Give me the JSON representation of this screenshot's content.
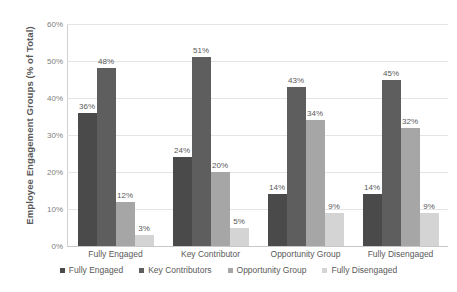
{
  "chart_data": {
    "type": "bar",
    "title": "",
    "xlabel": "",
    "ylabel": "Employee Engagement Groups (% of Total)",
    "ylim": [
      0,
      60
    ],
    "ytick_labels": [
      "60%",
      "50%",
      "40%",
      "30%",
      "20%",
      "10%",
      "0%"
    ],
    "ytick_values": [
      60,
      50,
      40,
      30,
      20,
      10,
      0
    ],
    "grid": true,
    "legend_position": "bottom",
    "categories": [
      "Fully Engaged",
      "Key Contributor",
      "Opportunity Group",
      "Fully Disengaged"
    ],
    "series": [
      {
        "name": "Fully Engaged",
        "color": "#4a4a4a",
        "values": [
          36,
          24,
          14,
          14
        ],
        "labels": [
          "36%",
          "24%",
          "14%",
          "14%"
        ]
      },
      {
        "name": "Key Contributors",
        "color": "#5e5e5e",
        "values": [
          48,
          51,
          43,
          45
        ],
        "labels": [
          "48%",
          "51%",
          "43%",
          "45%"
        ]
      },
      {
        "name": "Opportunity Group",
        "color": "#a6a6a6",
        "values": [
          12,
          20,
          34,
          32
        ],
        "labels": [
          "12%",
          "20%",
          "34%",
          "32%"
        ]
      },
      {
        "name": "Fully Disengaged",
        "color": "#d4d4d4",
        "values": [
          3,
          5,
          9,
          9
        ],
        "labels": [
          "3%",
          "5%",
          "9%",
          "9%"
        ]
      }
    ]
  },
  "colors": {
    "gridline": "#e4e4e4",
    "axis": "#c8c8c8",
    "text": "#595959",
    "tick_text": "#808080",
    "background": "#ffffff"
  }
}
